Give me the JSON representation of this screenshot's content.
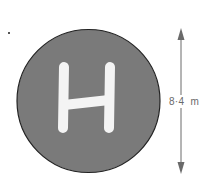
{
  "diagram": {
    "pad": {
      "letter": "H",
      "fill_color": "#7a7a7a",
      "outline_color": "#222222",
      "letter_color": "#f4f4f4"
    },
    "dimension": {
      "label": "8·4  m",
      "value": 8.4,
      "unit": "m",
      "meaning": "diameter",
      "arrow_color": "#6a6a6a"
    }
  }
}
